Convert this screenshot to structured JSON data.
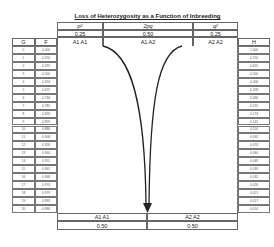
{
  "title": "Loss of Heterozygosity as a Function of Inbreeding",
  "top_header": {
    "columns": [
      {
        "freq_label": "p",
        "freq_sup": "2",
        "value": "0.25",
        "genotype": "A1 A1"
      },
      {
        "freq_label": "2pq",
        "freq_sup": "",
        "value": "0.50",
        "genotype": "A1 A2"
      },
      {
        "freq_label": "q",
        "freq_sup": "2",
        "value": "0.25",
        "genotype": "A2 A2"
      }
    ]
  },
  "left_table": {
    "headers": [
      "G",
      "F"
    ],
    "G": [
      "0",
      "1",
      "2",
      "3",
      "4",
      "5",
      "6",
      "7",
      "8",
      "9",
      "10",
      "11",
      "12",
      "13",
      "14",
      "15",
      "16",
      "17",
      "18",
      "19",
      "20"
    ],
    "F": [
      "0.000",
      "0.250",
      "0.375",
      "0.500",
      "0.594",
      "0.672",
      "0.734",
      "0.785",
      "0.826",
      "0.859",
      "0.886",
      "0.908",
      "0.926",
      "0.940",
      "0.951",
      "0.961",
      "0.968",
      "0.974",
      "0.979",
      "0.983",
      "0.986"
    ]
  },
  "right_table": {
    "header": "H",
    "H": [
      "1.000",
      "0.750",
      "0.625",
      "0.500",
      "0.406",
      "0.328",
      "0.266",
      "0.215",
      "0.174",
      "0.141",
      "0.114",
      "0.092",
      "0.074",
      "0.060",
      "0.049",
      "0.039",
      "0.032",
      "0.026",
      "0.021",
      "0.017",
      "0.014"
    ]
  },
  "bottom": {
    "columns": [
      {
        "genotype": "A1 A1",
        "value": "0.50"
      },
      {
        "genotype": "A2 A2",
        "value": "0.50"
      }
    ]
  },
  "chart_data": {
    "type": "table",
    "title": "Loss of Heterozygosity as a Function of Inbreeding",
    "columns": [
      "G",
      "F",
      "H"
    ],
    "G": [
      0,
      1,
      2,
      3,
      4,
      5,
      6,
      7,
      8,
      9,
      10,
      11,
      12,
      13,
      14,
      15,
      16,
      17,
      18,
      19,
      20
    ],
    "F": [
      0.0,
      0.25,
      0.375,
      0.5,
      0.594,
      0.672,
      0.734,
      0.785,
      0.826,
      0.859,
      0.886,
      0.908,
      0.926,
      0.94,
      0.951,
      0.961,
      0.968,
      0.974,
      0.979,
      0.983,
      0.986
    ],
    "H": [
      1.0,
      0.75,
      0.625,
      0.5,
      0.406,
      0.328,
      0.266,
      0.215,
      0.174,
      0.141,
      0.114,
      0.092,
      0.074,
      0.06,
      0.049,
      0.039,
      0.032,
      0.026,
      0.021,
      0.017,
      0.014
    ],
    "initial_genotype_freqs": {
      "A1A1": 0.25,
      "A1A2": 0.5,
      "A2A2": 0.25
    },
    "final_genotype_freqs": {
      "A1A1": 0.5,
      "A2A2": 0.5
    }
  }
}
